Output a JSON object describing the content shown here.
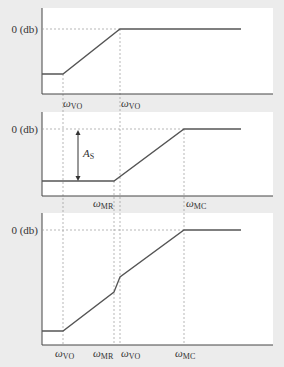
{
  "colors": {
    "background": "#ececec",
    "panel": "#ffffff",
    "curve": "#555555",
    "axis": "#444444",
    "guide": "#999999"
  },
  "panels": [
    {
      "id": "top",
      "y_label": "0 (db)",
      "x_labels": [
        {
          "symbol": "ω",
          "sub": "VO"
        },
        {
          "symbol": "ω",
          "sub": "VO"
        }
      ]
    },
    {
      "id": "middle",
      "y_label": "0 (db)",
      "annotation": {
        "symbol": "A",
        "sub": "S"
      },
      "x_labels": [
        {
          "symbol": "ω",
          "sub": "MR"
        },
        {
          "symbol": "ω",
          "sub": "MC"
        }
      ]
    },
    {
      "id": "bottom",
      "y_label": "0 (db)",
      "x_labels": [
        {
          "symbol": "ω",
          "sub": "VO"
        },
        {
          "symbol": "ω",
          "sub": "MR"
        },
        {
          "symbol": "ω",
          "sub": "VO"
        },
        {
          "symbol": "ω",
          "sub": "MC"
        }
      ]
    }
  ]
}
